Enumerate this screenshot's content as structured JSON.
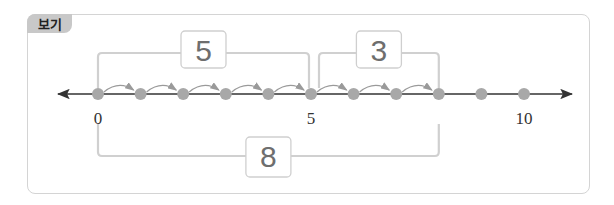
{
  "tag": "보기",
  "number_line": {
    "min": 0,
    "max": 10,
    "points": [
      0,
      1,
      2,
      3,
      4,
      5,
      6,
      7,
      8,
      9,
      10
    ],
    "tick_labels": [
      {
        "value": 0,
        "text": "0"
      },
      {
        "value": 5,
        "text": "5"
      },
      {
        "value": 10,
        "text": "10"
      }
    ],
    "jumps": [
      {
        "from": 0,
        "to": 1
      },
      {
        "from": 1,
        "to": 2
      },
      {
        "from": 2,
        "to": 3
      },
      {
        "from": 3,
        "to": 4
      },
      {
        "from": 4,
        "to": 5
      },
      {
        "from": 5,
        "to": 6
      },
      {
        "from": 6,
        "to": 7
      },
      {
        "from": 7,
        "to": 8
      }
    ]
  },
  "brackets": [
    {
      "from": 0,
      "to": 5,
      "label": "5",
      "position": "top"
    },
    {
      "from": 5,
      "to": 8,
      "label": "3",
      "position": "top"
    },
    {
      "from": 0,
      "to": 8,
      "label": "8",
      "position": "bottom"
    }
  ],
  "colors": {
    "dot": "#a8a8a8",
    "bracket": "#d0d0d0",
    "axis": "#333333",
    "jump_arrow": "#9a9a9a",
    "box_border": "#cfcfcf",
    "tag_bg": "#c8c8c8"
  }
}
